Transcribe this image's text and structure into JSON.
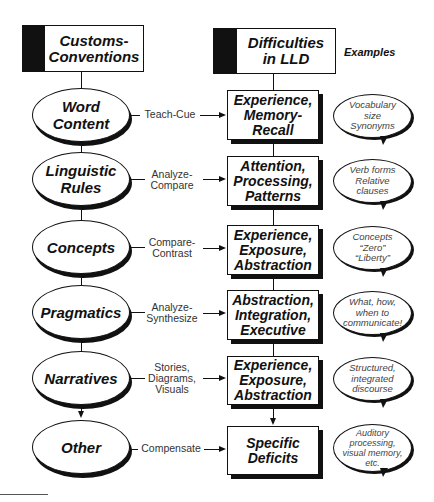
{
  "headers": {
    "left": "Customs-\nConventions",
    "right": "Difficulties\nin LLD",
    "examples": "Examples"
  },
  "rows": [
    {
      "oval": "Word\nContent",
      "connector": "Teach-Cue",
      "box": "Experience,\nMemory-\nRecall",
      "example": "Vocabulary\nsize\nSynonyms"
    },
    {
      "oval": "Linguistic\nRules",
      "connector": "Analyze-\nCompare",
      "box": "Attention,\nProcessing,\nPatterns",
      "example": "Verb forms\nRelative\nclauses"
    },
    {
      "oval": "Concepts",
      "connector": "Compare-\nContrast",
      "box": "Experience,\nExposure,\nAbstraction",
      "example": "Concepts\n“Zero”\n“Liberty”"
    },
    {
      "oval": "Pragmatics",
      "connector": "Analyze-\nSynthesize",
      "box": "Abstraction,\nIntegration,\nExecutive",
      "example": "What, how,\nwhen to\ncommunicate!"
    },
    {
      "oval": "Narratives",
      "connector": "Stories,\nDiagrams,\nVisuals",
      "box": "Experience,\nExposure,\nAbstraction",
      "example": "Structured,\nintegrated\ndiscourse"
    },
    {
      "oval": "Other",
      "connector": "Compensate",
      "box": "Specific\nDeficits",
      "example": "Auditory\nprocessing,\nvisual memory,\netc."
    }
  ]
}
